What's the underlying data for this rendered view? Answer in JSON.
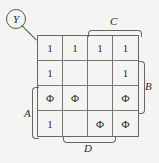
{
  "kmap": {
    "output_label": "Y",
    "variables": {
      "top": "C",
      "right": "B",
      "left": "A",
      "bottom": "D"
    },
    "cells": [
      [
        "1",
        "1",
        "1",
        "1"
      ],
      [
        "1",
        "",
        "",
        "1"
      ],
      [
        "Φ",
        "Φ",
        "",
        "Φ"
      ],
      [
        "1",
        "",
        "Φ",
        "Φ"
      ]
    ]
  }
}
